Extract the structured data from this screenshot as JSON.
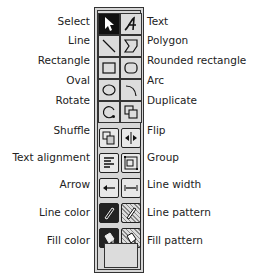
{
  "left_labels": [
    {
      "id": "select",
      "label": "Select",
      "top": 15
    },
    {
      "id": "line",
      "label": "Line",
      "top": 34
    },
    {
      "id": "rectangle",
      "label": "Rectangle",
      "top": 54
    },
    {
      "id": "oval",
      "label": "Oval",
      "top": 74
    },
    {
      "id": "rotate",
      "label": "Rotate",
      "top": 94
    },
    {
      "id": "shuffle",
      "label": "Shuffle",
      "top": 124
    },
    {
      "id": "text-alignment",
      "label": "Text alignment",
      "top": 151
    },
    {
      "id": "arrow",
      "label": "Arrow",
      "top": 178
    },
    {
      "id": "line-color",
      "label": "Line color",
      "top": 206
    },
    {
      "id": "fill-color",
      "label": "Fill color",
      "top": 234
    }
  ],
  "right_labels": [
    {
      "id": "text",
      "label": "Text",
      "top": 15
    },
    {
      "id": "polygon",
      "label": "Polygon",
      "top": 34
    },
    {
      "id": "rounded-rectangle",
      "label": "Rounded rectangle",
      "top": 54
    },
    {
      "id": "arc",
      "label": "Arc",
      "top": 74
    },
    {
      "id": "duplicate",
      "label": "Duplicate",
      "top": 94
    },
    {
      "id": "flip",
      "label": "Flip",
      "top": 124
    },
    {
      "id": "group",
      "label": "Group",
      "top": 151
    },
    {
      "id": "line-width",
      "label": "Line width",
      "top": 178
    },
    {
      "id": "line-pattern",
      "label": "Line pattern",
      "top": 206
    },
    {
      "id": "fill-pattern",
      "label": "Fill pattern",
      "top": 234
    }
  ]
}
